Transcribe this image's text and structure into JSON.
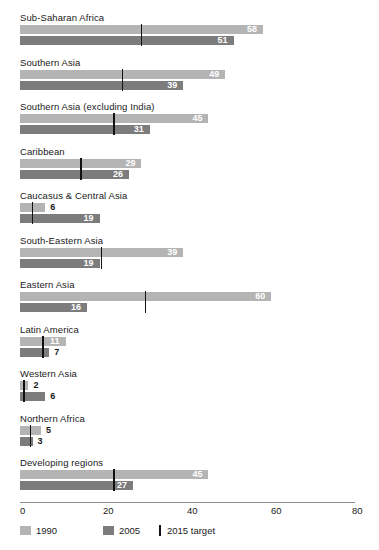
{
  "chart_data": {
    "type": "bar",
    "orientation": "horizontal",
    "title": "",
    "subtitle": "",
    "xlabel": "",
    "ylabel": "",
    "xlim": [
      0,
      80
    ],
    "xticks": [
      0,
      20,
      40,
      60,
      80
    ],
    "xtick_labels": [
      "0",
      "20",
      "40",
      "60",
      "80"
    ],
    "grid": false,
    "legend_position": "bottom-left",
    "categories": [
      "Sub-Saharan Africa",
      "Southern Asia",
      "Southern Asia (excluding India)",
      "Caribbean",
      "Caucasus & Central Asia",
      "South-Eastern Asia",
      "Eastern Asia",
      "Latin America",
      "Western Asia",
      "Northern Africa",
      "Developing regions"
    ],
    "series": [
      {
        "name": "1990",
        "color": "#b4b4b4",
        "values": [
          58,
          49,
          45,
          29,
          6,
          39,
          60,
          11,
          2,
          5,
          45
        ]
      },
      {
        "name": "2005",
        "color": "#7c7c7c",
        "values": [
          51,
          39,
          31,
          26,
          19,
          19,
          16,
          7,
          6,
          3,
          27
        ]
      }
    ],
    "markers": {
      "name": "2015 target",
      "color": "#111111",
      "values": [
        29,
        24.5,
        22.5,
        14.5,
        3,
        19.5,
        30,
        5.5,
        1,
        2.5,
        22.5
      ]
    },
    "legend": [
      {
        "label": "1990",
        "swatch": "light-gray-square",
        "color": "#b4b4b4"
      },
      {
        "label": "2005",
        "swatch": "dark-gray-square",
        "color": "#7c7c7c"
      },
      {
        "label": "2015 target",
        "swatch": "vertical-tick",
        "color": "#111111"
      }
    ]
  },
  "axis": {
    "tick_0": "0",
    "tick_20": "20",
    "tick_40": "40",
    "tick_60": "60",
    "tick_80": "80"
  },
  "rows": [
    {
      "label": "Sub-Saharan Africa",
      "v1990": "58",
      "v2005": "51",
      "target": "29"
    },
    {
      "label": "Southern Asia",
      "v1990": "49",
      "v2005": "39",
      "target": "24.5"
    },
    {
      "label": "Southern Asia (excluding India)",
      "v1990": "45",
      "v2005": "31",
      "target": "22.5"
    },
    {
      "label": "Caribbean",
      "v1990": "29",
      "v2005": "26",
      "target": "14.5"
    },
    {
      "label": "Caucasus & Central Asia",
      "v1990": "6",
      "v2005": "19",
      "target": "3"
    },
    {
      "label": "South-Eastern Asia",
      "v1990": "39",
      "v2005": "19",
      "target": "19.5"
    },
    {
      "label": "Eastern Asia",
      "v1990": "60",
      "v2005": "16",
      "target": "30"
    },
    {
      "label": "Latin America",
      "v1990": "11",
      "v2005": "7",
      "target": "5.5"
    },
    {
      "label": "Western Asia",
      "v1990": "2",
      "v2005": "6",
      "target": "1"
    },
    {
      "label": "Northern Africa",
      "v1990": "5",
      "v2005": "3",
      "target": "2.5"
    },
    {
      "label": "Developing regions",
      "v1990": "45",
      "v2005": "27",
      "target": "22.5"
    }
  ],
  "legend": {
    "item_1990": "1990",
    "item_2005": "2005",
    "item_target": "2015 target"
  }
}
